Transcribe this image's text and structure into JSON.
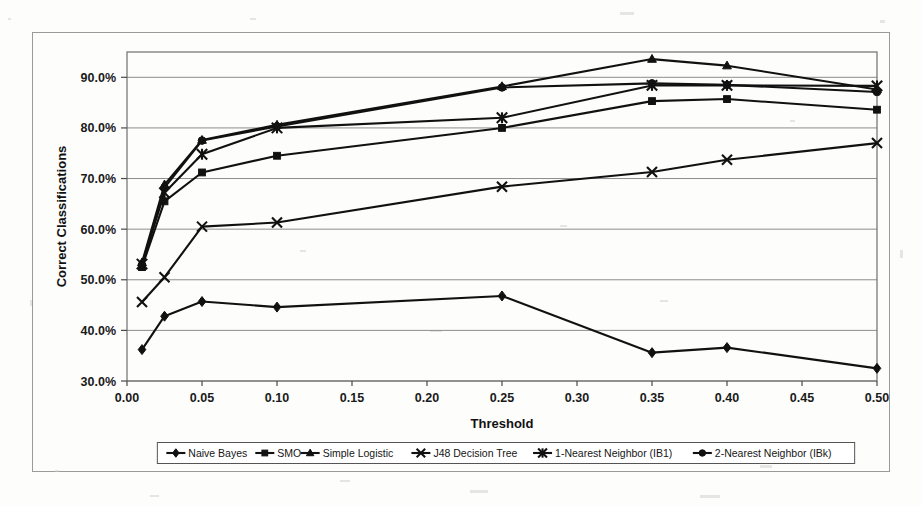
{
  "chart_data": {
    "type": "line",
    "title": "",
    "xlabel": "Threshold",
    "ylabel": "Correct Classifications",
    "xlim": [
      0.0,
      0.5
    ],
    "ylim": [
      0.3,
      0.95
    ],
    "grid": true,
    "legend_position": "bottom",
    "x_tick_labels": [
      "0.00",
      "0.05",
      "0.10",
      "0.15",
      "0.20",
      "0.25",
      "0.30",
      "0.35",
      "0.40",
      "0.45",
      "0.50"
    ],
    "x_tick_values": [
      0.0,
      0.05,
      0.1,
      0.15,
      0.2,
      0.25,
      0.3,
      0.35,
      0.4,
      0.45,
      0.5
    ],
    "y_tick_labels": [
      "30.0%",
      "40.0%",
      "50.0%",
      "60.0%",
      "70.0%",
      "80.0%",
      "90.0%"
    ],
    "y_tick_values": [
      0.3,
      0.4,
      0.5,
      0.6,
      0.7,
      0.8,
      0.9
    ],
    "x": [
      0.01,
      0.025,
      0.05,
      0.1,
      0.25,
      0.35,
      0.4,
      0.5
    ],
    "series": [
      {
        "name": "Naive Bayes",
        "marker": "diamond",
        "values": [
          0.362,
          0.428,
          0.457,
          0.446,
          0.468,
          0.356,
          0.366,
          0.325
        ]
      },
      {
        "name": "SMO",
        "marker": "square",
        "values": [
          0.525,
          0.655,
          0.712,
          0.745,
          0.8,
          0.853,
          0.857,
          0.836
        ]
      },
      {
        "name": "Simple Logistic",
        "marker": "triangle",
        "values": [
          0.534,
          0.688,
          0.776,
          0.806,
          0.882,
          0.936,
          0.923,
          0.876
        ]
      },
      {
        "name": "J48 Decision Tree",
        "marker": "cross",
        "values": [
          0.456,
          0.505,
          0.605,
          0.613,
          0.684,
          0.713,
          0.737,
          0.77
        ]
      },
      {
        "name": "1-Nearest Neighbor (IB1)",
        "marker": "star",
        "values": [
          0.531,
          0.672,
          0.748,
          0.8,
          0.82,
          0.884,
          0.884,
          0.883
        ]
      },
      {
        "name": "2-Nearest Neighbor (IBk)",
        "marker": "circle",
        "values": [
          0.529,
          0.682,
          0.775,
          0.803,
          0.88,
          0.888,
          0.885,
          0.871
        ]
      }
    ]
  },
  "axes": {
    "x_title": "Threshold",
    "y_title": "Correct Classifications"
  },
  "legend": {
    "items": [
      {
        "label": "Naive Bayes",
        "marker": "diamond"
      },
      {
        "label": "SMO",
        "marker": "square"
      },
      {
        "label": "Simple Logistic",
        "marker": "triangle"
      },
      {
        "label": "J48 Decision Tree",
        "marker": "cross"
      },
      {
        "label": "1-Nearest Neighbor (IB1)",
        "marker": "star"
      },
      {
        "label": "2-Nearest Neighbor (IBk)",
        "marker": "circle"
      }
    ]
  },
  "colors": {
    "series": "#111111",
    "grid": "#8d8d8d",
    "frame": "#9a9a9a",
    "background": "#ffffff"
  }
}
